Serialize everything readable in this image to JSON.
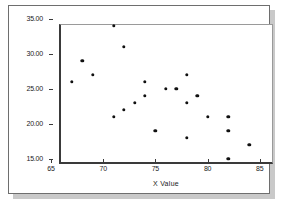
{
  "chart_data": {
    "type": "scatter",
    "title": "",
    "xlabel": "X Value",
    "ylabel": "",
    "xlim": [
      65,
      85.5
    ],
    "ylim": [
      15,
      35
    ],
    "grid": false,
    "legend": "none",
    "x_ticks": [
      "65",
      "70",
      "75",
      "80",
      "85"
    ],
    "x_tick_values": [
      65,
      70,
      75,
      80,
      85
    ],
    "y_ticks": [
      "35.00",
      "30.00",
      "25.00",
      "20.00",
      "15.00"
    ],
    "y_tick_values": [
      35,
      30,
      25,
      20,
      15
    ],
    "series": [
      {
        "name": "",
        "marker": "filled-circle",
        "color": "#111111",
        "points": [
          [
            67,
            26
          ],
          [
            68,
            29
          ],
          [
            69,
            27
          ],
          [
            71,
            34
          ],
          [
            71,
            21
          ],
          [
            72,
            31
          ],
          [
            72,
            22
          ],
          [
            73,
            23
          ],
          [
            74,
            26
          ],
          [
            74,
            24
          ],
          [
            75,
            19
          ],
          [
            76,
            25
          ],
          [
            77,
            25
          ],
          [
            78,
            27
          ],
          [
            78,
            23
          ],
          [
            78,
            18
          ],
          [
            79,
            24
          ],
          [
            80,
            21
          ],
          [
            82,
            21
          ],
          [
            82,
            19
          ],
          [
            82,
            15
          ],
          [
            84,
            17
          ]
        ]
      }
    ]
  },
  "style": {
    "marker_color": "#111111",
    "axis_color": "#3a3a3a",
    "frame_color": "#6e6e6e",
    "plot_border_color": "#9a9a9a",
    "background": "#ffffff",
    "shadow_color": "#c9c9c9"
  }
}
